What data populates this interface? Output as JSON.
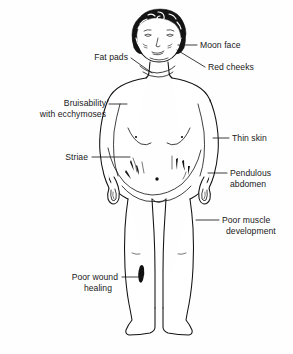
{
  "figure": {
    "background_color": "#fefefe",
    "line_color": "#111111",
    "text_color": "#1a1a1a"
  },
  "labels": [
    {
      "id": "moon-face",
      "text": "Moon face",
      "position": "right",
      "lines": [
        "Moon face"
      ],
      "text_x": 200,
      "text_y": 48,
      "align": "start"
    },
    {
      "id": "red-cheeks",
      "text": "Red cheeks",
      "position": "right",
      "lines": [
        "Red cheeks"
      ],
      "text_x": 208,
      "text_y": 70,
      "align": "start"
    },
    {
      "id": "fat-pads",
      "text": "Fat pads",
      "position": "left",
      "lines": [
        "Fat pads"
      ],
      "text_x": 128,
      "text_y": 60,
      "align": "end"
    },
    {
      "id": "bruisability-with-ecchymoses",
      "text": "Bruisability with ecchymoses",
      "position": "left",
      "lines": [
        "Bruisability",
        "with ecchymoses"
      ],
      "text_x": 106,
      "text_y": 106,
      "align": "end"
    },
    {
      "id": "striae",
      "text": "Striae",
      "position": "left",
      "lines": [
        "Striae"
      ],
      "text_x": 88,
      "text_y": 159,
      "align": "end"
    },
    {
      "id": "thin-skin",
      "text": "Thin skin",
      "position": "right",
      "lines": [
        "Thin skin"
      ],
      "text_x": 232,
      "text_y": 141,
      "align": "start"
    },
    {
      "id": "pendulous-abdomen",
      "text": "Pendulous abdomen",
      "position": "right",
      "lines": [
        "Pendulous",
        "abdomen"
      ],
      "text_x": 230,
      "text_y": 176,
      "align": "start"
    },
    {
      "id": "poor-muscle-development",
      "text": "Poor muscle development",
      "position": "right",
      "lines": [
        "Poor muscle",
        "development"
      ],
      "text_x": 222,
      "text_y": 223,
      "align": "start"
    },
    {
      "id": "poor-wound-healing",
      "text": "Poor wound healing",
      "position": "left",
      "lines": [
        "Poor wound",
        "healing"
      ],
      "text_x": 118,
      "text_y": 280,
      "align": "end"
    }
  ],
  "anatomy_features": [
    {
      "id": "hair",
      "name": "curly dark hair"
    },
    {
      "id": "face",
      "name": "rounded moon face"
    },
    {
      "id": "cheeks",
      "name": "full red cheeks"
    },
    {
      "id": "supraclavicular-fat-pads",
      "name": "fat pads at neck"
    },
    {
      "id": "torso",
      "name": "trunk with thin skin"
    },
    {
      "id": "abdomen",
      "name": "pendulous abdomen with striae"
    },
    {
      "id": "navel",
      "name": "umbilicus"
    },
    {
      "id": "arms",
      "name": "thin arms"
    },
    {
      "id": "legs",
      "name": "thin legs, poor muscle development"
    },
    {
      "id": "wound",
      "name": "dark wound on right leg"
    },
    {
      "id": "striae-marks",
      "name": "abdominal striae streaks"
    }
  ]
}
